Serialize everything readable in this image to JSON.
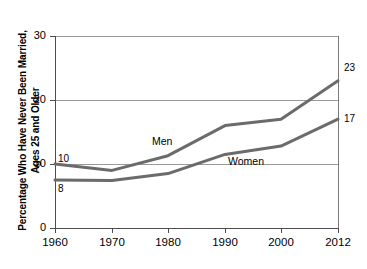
{
  "chart_data": {
    "type": "line",
    "title": "",
    "xlabel": "",
    "ylabel": "Percentage Who Have Never Been Married,\nAges 25 and Older",
    "x": [
      1960,
      1970,
      1980,
      1990,
      2000,
      2012
    ],
    "xticklabels": [
      "1960",
      "1970",
      "1980",
      "1990",
      "2000",
      "2012"
    ],
    "yticklabels": [
      "0",
      "10",
      "20",
      "30"
    ],
    "yticks": [
      0,
      10,
      20,
      30
    ],
    "ylim": [
      0,
      30
    ],
    "xlim": [
      1960,
      2012
    ],
    "grid": "horizontal",
    "legend": "inline-labels",
    "line_color": "#6b6b6b",
    "series": [
      {
        "name": "Men",
        "label": "Men",
        "start_label": "10",
        "end_label": "23",
        "values": [
          10,
          9,
          11.3,
          16,
          17,
          23
        ]
      },
      {
        "name": "Women",
        "label": "Women",
        "start_label": "8",
        "end_label": "17",
        "values": [
          7.5,
          7.4,
          8.5,
          11.5,
          12.8,
          17
        ]
      }
    ],
    "annotations": [
      {
        "text": "Men",
        "x": 1982.5,
        "y": 13.3
      },
      {
        "text": "Women",
        "x": 1996,
        "y": 11.1
      },
      {
        "text": "10",
        "x": 1960.5,
        "y": 11.2
      },
      {
        "text": "8",
        "x": 1960.5,
        "y": 6.3
      },
      {
        "text": "23",
        "x": 2013,
        "y": 23
      },
      {
        "text": "17",
        "x": 2013,
        "y": 17
      }
    ]
  }
}
